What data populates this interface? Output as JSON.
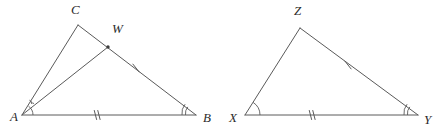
{
  "figure": {
    "background_color": "#ffffff",
    "stroke_color": "#5a5a5a",
    "label_color": "#2b2b2b"
  },
  "left_figure": {
    "name": "triangle-ABC-with-cevian-AW",
    "vertices": [
      {
        "id": "A",
        "label": "A",
        "x": 22,
        "y": 115,
        "label_x": 10,
        "label_y": 121
      },
      {
        "id": "B",
        "label": "B",
        "x": 196,
        "y": 115,
        "label_x": 203,
        "label_y": 122
      },
      {
        "id": "C",
        "label": "C",
        "x": 78,
        "y": 25,
        "label_x": 71,
        "label_y": 14
      },
      {
        "id": "W",
        "label": "W",
        "x": 108,
        "y": 47,
        "label_x": 112,
        "label_y": 33
      }
    ],
    "segments": [
      {
        "name": "segment-AC",
        "from": "A",
        "to": "C"
      },
      {
        "name": "segment-CB",
        "from": "C",
        "to": "B"
      },
      {
        "name": "segment-AB",
        "from": "A",
        "to": "B"
      },
      {
        "name": "segment-AW",
        "from": "A",
        "to": "W"
      }
    ],
    "point_markers": [
      {
        "name": "point-W-dot",
        "x": 108,
        "y": 47,
        "r": 1.7
      }
    ],
    "angle_arcs": [
      {
        "name": "angle-arc-at-A-inner",
        "vertex": "A",
        "radius": 11,
        "count": 1
      },
      {
        "name": "angle-arc-at-A-outer",
        "vertex": "A",
        "radius": 16,
        "count": 1
      },
      {
        "name": "angle-arc-at-B-double",
        "vertex": "B",
        "radius": 14,
        "count": 2
      }
    ],
    "tick_marks": [
      {
        "name": "tick-on-WB-single",
        "segment": "W-B",
        "x": 136,
        "y": 68,
        "count": 1
      },
      {
        "name": "tick-on-AB-double",
        "segment": "A-B",
        "x": 97,
        "y": 115,
        "count": 2
      }
    ]
  },
  "right_figure": {
    "name": "triangle-XYZ",
    "vertices": [
      {
        "id": "X",
        "label": "X",
        "x": 245,
        "y": 115,
        "label_x": 231,
        "label_y": 122
      },
      {
        "id": "Y",
        "label": "Y",
        "x": 418,
        "y": 115,
        "label_x": 424,
        "label_y": 124
      },
      {
        "id": "Z",
        "label": "Z",
        "x": 300,
        "y": 28,
        "label_x": 294,
        "label_y": 15
      }
    ],
    "segments": [
      {
        "name": "segment-XZ",
        "from": "X",
        "to": "Z"
      },
      {
        "name": "segment-ZY",
        "from": "Z",
        "to": "Y"
      },
      {
        "name": "segment-XY",
        "from": "X",
        "to": "Y"
      }
    ],
    "angle_arcs": [
      {
        "name": "angle-arc-at-X-single",
        "vertex": "X",
        "radius": 15,
        "count": 1
      },
      {
        "name": "angle-arc-at-Y-double",
        "vertex": "Y",
        "radius": 14,
        "count": 2
      }
    ],
    "tick_marks": [
      {
        "name": "tick-on-ZY-single",
        "segment": "Z-Y",
        "x": 348,
        "y": 65,
        "count": 1
      },
      {
        "name": "tick-on-XY-double",
        "segment": "X-Y",
        "x": 312,
        "y": 115,
        "count": 2
      }
    ]
  },
  "labels": {
    "A": "A",
    "B": "B",
    "C": "C",
    "W": "W",
    "X": "X",
    "Y": "Y",
    "Z": "Z"
  }
}
